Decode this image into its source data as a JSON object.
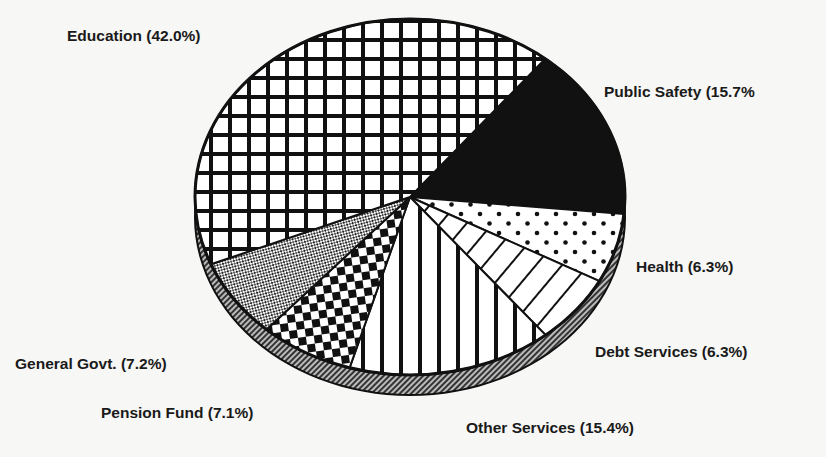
{
  "chart_data": {
    "type": "pie",
    "title": "",
    "style": "3D pie, black & white hatch patterns",
    "categories": [
      "Education",
      "Public Safety",
      "Health",
      "Debt Services",
      "Other Services",
      "Pension Fund",
      "General Govt."
    ],
    "values": [
      42.0,
      15.7,
      6.3,
      6.3,
      15.4,
      7.1,
      7.2
    ],
    "unit": "%",
    "labels": [
      "Education (42.0%)",
      "Public Safety (15.7%",
      "Health (6.3%)",
      "Debt Services (6.3%)",
      "Other Services (15.4%)",
      "Pension Fund (7.1%)",
      "General Govt. (7.2%)"
    ],
    "patterns": [
      "grid",
      "solid-black",
      "dots",
      "diagonal-lines",
      "vertical-lines",
      "checkerboard",
      "fine-crosshatch"
    ],
    "legend": "none (inline labels)"
  }
}
